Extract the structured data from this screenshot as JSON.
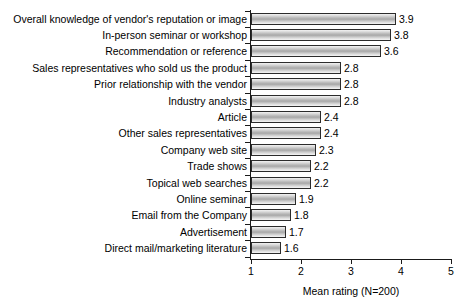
{
  "chart_data": {
    "type": "bar",
    "orientation": "horizontal",
    "title": "",
    "subtitle": "",
    "xlabel": "Mean rating (N=200)",
    "ylabel": "",
    "xlim": [
      1,
      5
    ],
    "xticks": [
      1,
      2,
      3,
      4,
      5
    ],
    "xtick_labels": [
      "1",
      "2",
      "3",
      "4",
      "5"
    ],
    "grid": false,
    "legend": null,
    "categories": [
      "Overall knowledge of vendor's reputation or image",
      "In-person seminar or workshop",
      "Recommendation or reference",
      "Sales representatives who sold us the product",
      "Prior relationship with the vendor",
      "Industry analysts",
      "Article",
      "Other sales representatives",
      "Company web site",
      "Trade shows",
      "Topical web searches",
      "Online seminar",
      "Email from the Company",
      "Advertisement",
      "Direct mail/marketing literature"
    ],
    "values": [
      3.9,
      3.8,
      3.6,
      2.8,
      2.8,
      2.8,
      2.4,
      2.4,
      2.3,
      2.2,
      2.2,
      1.9,
      1.8,
      1.7,
      1.6
    ],
    "data_labels": [
      "3.9",
      "3.8",
      "3.6",
      "2.8",
      "2.8",
      "2.8",
      "2.4",
      "2.4",
      "2.3",
      "2.2",
      "2.2",
      "1.9",
      "1.8",
      "1.7",
      "1.6"
    ],
    "colors": {
      "bar_fill_light": "#f2f2f2",
      "bar_fill_mid": "#a8a8a8",
      "bar_border": "#2b2b2b",
      "axis": "#1a1a1a",
      "text": "#000000",
      "background": "#ffffff"
    }
  }
}
